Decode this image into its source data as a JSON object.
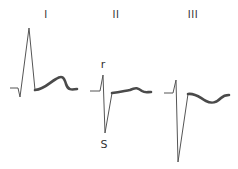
{
  "diagram": {
    "type": "ecg-leads",
    "colors": {
      "trace": "#555555",
      "st_segment": "#4a4a4a",
      "text": "#333333"
    },
    "leads": [
      {
        "label": "I",
        "label_pos": [
          46,
          10
        ],
        "qrs_path": "M10,88 L18,88 L20,97 L29,28 L35,90",
        "st_path": "M35,90 C45,89 50,82 56,79 C62,75 64,77 66,84 C68,90 71,90 77,89"
      },
      {
        "label": "II",
        "label_pos": [
          116,
          10
        ],
        "qrs_path": "M90,91 L100,91 L103,75 L105,133 L112,93",
        "st_path": "M112,93 C120,92 124,91 130,90 C136,87 138,88 142,91 C145,93 147,92 151,92",
        "annotations": [
          {
            "text": "r",
            "pos": [
              103,
              59
            ]
          },
          {
            "text": "S",
            "pos": [
              104,
              139
            ]
          }
        ]
      },
      {
        "label": "III",
        "label_pos": [
          193,
          10
        ],
        "qrs_path": "M164,93 L173,93 L176,80 L178,162 L188,94",
        "st_path": "M188,94 C196,93 200,98 206,101 C212,104 216,103 221,98 C224,95 226,95 229,95"
      }
    ]
  }
}
